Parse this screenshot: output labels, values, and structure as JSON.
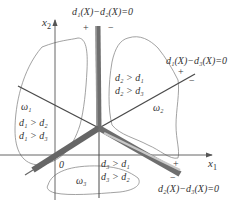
{
  "axes": {
    "x_label": "x",
    "x_sub": "1",
    "y_label": "x",
    "y_sub": "2",
    "origin_label": "0"
  },
  "boundaries": [
    {
      "id": "d1-d2",
      "label": "d₁(X)−d₂(X)=0",
      "plus": "+",
      "minus": "−"
    },
    {
      "id": "d1-d3",
      "label": "d₁(X)−d₃(X)=0",
      "plus": "+",
      "minus": "−"
    },
    {
      "id": "d2-d3",
      "label": "d₂(X)−d₃(X)=0",
      "plus": "+",
      "minus": "−"
    }
  ],
  "regions": [
    {
      "class": "ω₁",
      "cond1": "d₁ > d₂",
      "cond2": "d₁ > d₃"
    },
    {
      "class": "ω₂",
      "cond1": "d₂ > d₁",
      "cond2": "d₂ > d₃"
    },
    {
      "class": "ω₃",
      "cond1": "d₃ > d₁",
      "cond2": "d₃ > d₂"
    }
  ],
  "colors": {
    "thick_band": "#6e6e6e",
    "thin_line": "#4a4a4a",
    "blob": "#8a8a8a",
    "axis": "#555555"
  }
}
